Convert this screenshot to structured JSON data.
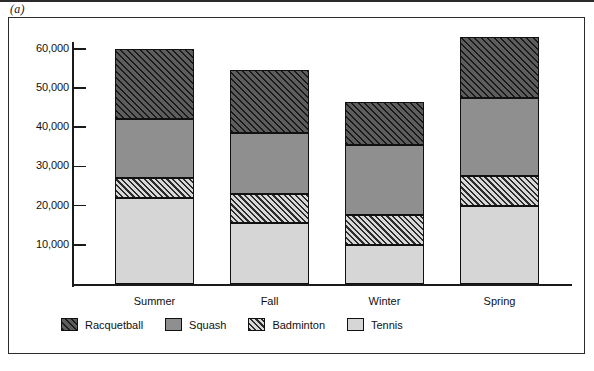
{
  "figure": {
    "label": "(a)"
  },
  "chart_data": {
    "type": "bar",
    "subtype": "stacked-bar",
    "title": "",
    "xlabel": "",
    "ylabel": "",
    "ylim": [
      0,
      65000
    ],
    "grid": false,
    "legend_position": "bottom-left",
    "categories": [
      "Summer",
      "Fall",
      "Winter",
      "Spring"
    ],
    "ytick_labels": [
      "60,000",
      "50,000",
      "40,000",
      "30,000",
      "20,000",
      "10,000"
    ],
    "ytick_values": [
      60000,
      50000,
      40000,
      30000,
      20000,
      10000
    ],
    "series": [
      {
        "name": "Tennis",
        "pattern": "solid-light",
        "color": "#d6d6d6",
        "values": [
          22000,
          15500,
          10000,
          20000
        ]
      },
      {
        "name": "Badminton",
        "pattern": "light-hatch",
        "color": "#d8d8d8",
        "values": [
          5000,
          7500,
          7500,
          7500
        ]
      },
      {
        "name": "Squash",
        "pattern": "solid-gray",
        "color": "#8f8f8f",
        "values": [
          15000,
          15500,
          18000,
          20000
        ]
      },
      {
        "name": "Racquetball",
        "pattern": "dark-hatch",
        "color": "#5d5d5d",
        "values": [
          18000,
          16000,
          11000,
          15500
        ]
      }
    ],
    "totals": [
      60000,
      54500,
      46500,
      63000
    ],
    "legend_entries": [
      "Racquetball",
      "Squash",
      "Badminton",
      "Tennis"
    ]
  }
}
